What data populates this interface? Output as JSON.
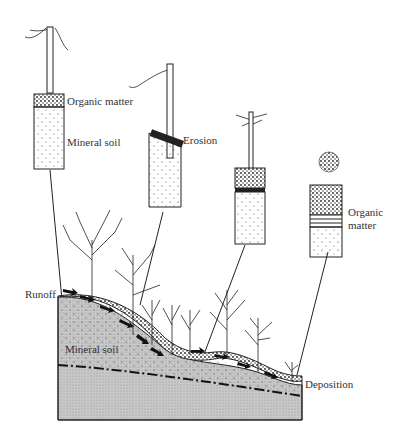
{
  "diagram": {
    "type": "soil-erosion-cross-section",
    "labels": {
      "organic_matter_1": "Organic matter",
      "mineral_soil_1": "Mineral soil",
      "erosion": "Erosion",
      "organic_matter_2a": "Organic",
      "organic_matter_2b": "matter",
      "runoff": "Runoff",
      "mineral_soil_2": "Mineral soil",
      "deposition": "Deposition"
    },
    "cores": [
      {
        "id": "core-1",
        "description": "hilltop core with thin organic layer over mineral soil"
      },
      {
        "id": "core-2",
        "description": "upper slope core with organic layer eroded away"
      },
      {
        "id": "core-3",
        "description": "lower slope core with organic layer and band"
      },
      {
        "id": "core-4",
        "description": "bottom core with deep deposited organic matter"
      }
    ],
    "colors": {
      "ink": "#1a1a1a",
      "bedrock": "#bdbdbd",
      "background": "#ffffff"
    }
  }
}
